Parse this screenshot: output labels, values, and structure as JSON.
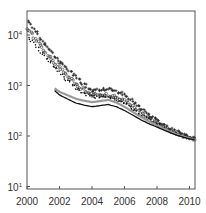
{
  "chart_data": {
    "type": "scatter",
    "title": "",
    "xlabel": "",
    "ylabel": "",
    "xlim": [
      2000,
      2010.3
    ],
    "ylim": [
      7,
      30000
    ],
    "yscale": "log",
    "grid": false,
    "legend": null,
    "x_ticks": [
      "2000",
      "2002",
      "2004",
      "2006",
      "2008",
      "2010"
    ],
    "y_ticks": [
      {
        "base": "10",
        "exp": "4",
        "value": 10000
      },
      {
        "base": "10",
        "exp": "3",
        "value": 1000
      },
      {
        "base": "10",
        "exp": "2",
        "value": 100
      },
      {
        "base": "10",
        "exp": "1",
        "value": 10
      }
    ],
    "series": [
      {
        "name": "crosses",
        "marker": "plus",
        "color": "#222222",
        "x": [
          2000,
          2000.5,
          2001,
          2001.5,
          2002,
          2002.5,
          2003,
          2003.5,
          2004,
          2004.5,
          2005,
          2005.5,
          2006,
          2006.5,
          2007,
          2007.5,
          2008,
          2008.5,
          2009,
          2009.5,
          2010,
          2010.3
        ],
        "values": [
          20000,
          12000,
          7000,
          4500,
          3000,
          2100,
          1500,
          1050,
          800,
          820,
          850,
          780,
          650,
          480,
          350,
          260,
          200,
          160,
          130,
          110,
          95,
          90
        ]
      },
      {
        "name": "open-circles",
        "marker": "circle-open",
        "color": "#333333",
        "x": [
          2000,
          2000.5,
          2001,
          2001.5,
          2002,
          2002.5,
          2003,
          2003.5,
          2004,
          2004.5,
          2005,
          2005.5,
          2006,
          2006.5,
          2007,
          2007.5,
          2008,
          2008.5,
          2009,
          2009.5,
          2010,
          2010.3
        ],
        "values": [
          14000,
          8500,
          5000,
          3300,
          2200,
          1550,
          1100,
          820,
          650,
          640,
          650,
          590,
          500,
          390,
          300,
          230,
          180,
          145,
          120,
          105,
          92,
          88
        ]
      },
      {
        "name": "dots",
        "marker": "dot",
        "color": "#111111",
        "x": [
          2000,
          2000.5,
          2001,
          2001.5,
          2002,
          2002.5,
          2003,
          2003.5,
          2004,
          2004.5,
          2005,
          2005.5,
          2006,
          2006.5,
          2007,
          2007.5,
          2008,
          2008.5,
          2009,
          2009.5,
          2010,
          2010.3
        ],
        "values": [
          10000,
          6300,
          4000,
          2700,
          1800,
          1250,
          900,
          700,
          600,
          580,
          580,
          530,
          450,
          350,
          270,
          210,
          170,
          138,
          115,
          100,
          90,
          86
        ]
      },
      {
        "name": "gray-line",
        "marker": "line",
        "color": "#999999",
        "x": [
          2001.7,
          2002,
          2002.5,
          2003,
          2003.5,
          2004,
          2004.5,
          2005,
          2005.5,
          2006,
          2006.5,
          2007,
          2007.5,
          2008,
          2008.5,
          2009,
          2009.5,
          2010,
          2010.3
        ],
        "values": [
          880,
          750,
          640,
          550,
          500,
          470,
          490,
          520,
          460,
          380,
          300,
          240,
          195,
          160,
          135,
          115,
          100,
          90,
          87
        ]
      },
      {
        "name": "black-line",
        "marker": "line",
        "color": "#111111",
        "x": [
          2001.7,
          2002,
          2002.5,
          2003,
          2003.5,
          2004,
          2004.5,
          2005,
          2005.5,
          2006,
          2006.5,
          2007,
          2007.5,
          2008,
          2008.5,
          2009,
          2009.5,
          2010,
          2010.3
        ],
        "values": [
          800,
          650,
          540,
          450,
          410,
          380,
          400,
          420,
          380,
          320,
          260,
          210,
          175,
          150,
          128,
          110,
          97,
          88,
          85
        ]
      }
    ]
  },
  "axes": {
    "frame_color": "#555555",
    "label_color": "#333333"
  }
}
